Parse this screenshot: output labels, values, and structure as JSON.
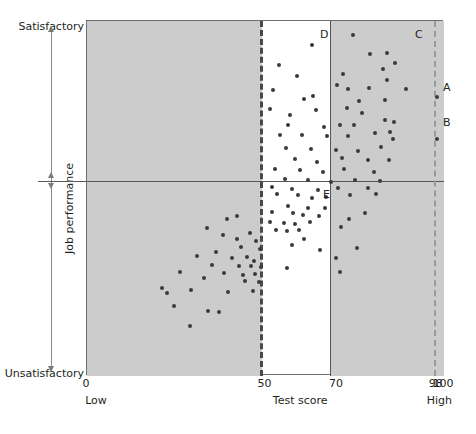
{
  "figure": {
    "y_axis": {
      "top_label": "Satisfactory",
      "bottom_label": "Unsatisfactory",
      "title": "Job performance"
    },
    "x_axis": {
      "title": "Test score",
      "low_label": "Low",
      "high_label": "High",
      "ticks": [
        {
          "value": 0,
          "label": "0"
        },
        {
          "value": 50,
          "label": "50"
        },
        {
          "value": 70,
          "label": "70"
        },
        {
          "value": 98,
          "label": "98"
        },
        {
          "value": 100,
          "label": "100"
        }
      ]
    },
    "quadrant_labels": [
      {
        "id": "D",
        "label": "D",
        "x": 233,
        "y": 8
      },
      {
        "id": "C",
        "label": "C",
        "x": 328,
        "y": 8
      },
      {
        "id": "E",
        "label": "E",
        "x": 236,
        "y": 168
      }
    ],
    "callouts": [
      {
        "id": "A",
        "label": "A",
        "x": 434,
        "y": 82
      },
      {
        "id": "B",
        "label": "B",
        "x": 434,
        "y": 117
      }
    ],
    "reference_lines": [
      {
        "name": "cutoff-50",
        "orientation": "vertical",
        "value": 50,
        "style": "dashed",
        "color": "#4a4a4a"
      },
      {
        "name": "cutoff-70",
        "orientation": "vertical",
        "value": 70,
        "style": "solid",
        "color": "#555555"
      },
      {
        "name": "cutoff-98",
        "orientation": "vertical",
        "value": 98,
        "style": "dashed",
        "color": "#9a9a9a"
      },
      {
        "name": "performance-midline",
        "orientation": "horizontal",
        "value": 50,
        "style": "solid",
        "color": "#555555"
      }
    ],
    "colors": {
      "shaded_region": "#cccccc",
      "plot_background": "#ffffff",
      "point": "#3a3a3a",
      "frame": "#6e6e6e",
      "text": "#231f20"
    },
    "shaded_regions": [
      {
        "name": "below-50",
        "x_from": 0,
        "x_to": 50
      },
      {
        "name": "above-70",
        "x_from": 70,
        "x_to": 100
      }
    ]
  },
  "chart_data": {
    "type": "scatter",
    "title": "",
    "xlabel": "Test score",
    "ylabel": "Job performance",
    "xlim": [
      0,
      100
    ],
    "ylim": [
      0,
      100
    ],
    "grid": false,
    "legend": null,
    "series": [
      {
        "name": "employees",
        "points": [
          [
            63.0,
            93.2
          ],
          [
            53.8,
            87.6
          ],
          [
            74.6,
            96.1
          ],
          [
            79.3,
            90.7
          ],
          [
            84.0,
            91.0
          ],
          [
            86.2,
            88.2
          ],
          [
            58.7,
            84.5
          ],
          [
            71.6,
            85.1
          ],
          [
            82.8,
            86.5
          ],
          [
            83.9,
            83.5
          ],
          [
            52.0,
            80.5
          ],
          [
            63.2,
            79.0
          ],
          [
            69.9,
            82.0
          ],
          [
            73.2,
            80.8
          ],
          [
            79.0,
            81.1
          ],
          [
            89.3,
            80.9
          ],
          [
            60.7,
            78.0
          ],
          [
            76.3,
            77.6
          ],
          [
            83.5,
            77.8
          ],
          [
            98.0,
            78.5
          ],
          [
            51.4,
            75.3
          ],
          [
            57.0,
            73.6
          ],
          [
            64.1,
            74.9
          ],
          [
            72.7,
            75.4
          ],
          [
            77.0,
            74.2
          ],
          [
            83.4,
            72.1
          ],
          [
            56.2,
            70.6
          ],
          [
            66.3,
            70.2
          ],
          [
            70.8,
            70.6
          ],
          [
            74.8,
            70.8
          ],
          [
            86.1,
            71.6
          ],
          [
            54.1,
            68.0
          ],
          [
            60.3,
            67.8
          ],
          [
            67.3,
            67.6
          ],
          [
            73.0,
            67.7
          ],
          [
            80.6,
            68.4
          ],
          [
            84.9,
            68.7
          ],
          [
            85.8,
            66.9
          ],
          [
            98.0,
            66.9
          ],
          [
            55.8,
            64.3
          ],
          [
            62.8,
            64.0
          ],
          [
            69.7,
            63.7
          ],
          [
            75.9,
            63.4
          ],
          [
            82.3,
            64.4
          ],
          [
            58.2,
            61.0
          ],
          [
            64.5,
            60.4
          ],
          [
            71.4,
            61.3
          ],
          [
            78.8,
            60.8
          ],
          [
            84.6,
            60.9
          ],
          [
            52.6,
            58.3
          ],
          [
            59.6,
            58.0
          ],
          [
            66.2,
            57.6
          ],
          [
            72.0,
            58.2
          ],
          [
            80.3,
            57.4
          ],
          [
            55.4,
            55.5
          ],
          [
            61.9,
            55.1
          ],
          [
            68.4,
            54.6
          ],
          [
            75.2,
            55.2
          ],
          [
            82.0,
            54.8
          ],
          [
            51.9,
            53.2
          ],
          [
            57.5,
            52.7
          ],
          [
            64.8,
            52.4
          ],
          [
            70.3,
            53.0
          ],
          [
            78.6,
            52.9
          ],
          [
            53.1,
            51.3
          ],
          [
            59.0,
            50.9
          ],
          [
            66.9,
            50.5
          ],
          [
            73.6,
            51.1
          ],
          [
            80.9,
            51.4
          ],
          [
            63.0,
            50.1
          ],
          [
            56.4,
            47.8
          ],
          [
            62.0,
            47.3
          ],
          [
            66.8,
            47.4
          ],
          [
            51.7,
            46.2
          ],
          [
            57.6,
            45.9
          ],
          [
            60.4,
            45.4
          ],
          [
            64.9,
            45.2
          ],
          [
            42.1,
            45.0
          ],
          [
            39.3,
            44.3
          ],
          [
            51.2,
            43.3
          ],
          [
            55.1,
            43.0
          ],
          [
            58.4,
            42.8
          ],
          [
            62.6,
            43.4
          ],
          [
            53.0,
            41.2
          ],
          [
            56.1,
            40.9
          ],
          [
            59.4,
            41.0
          ],
          [
            77.9,
            46.0
          ],
          [
            73.4,
            44.1
          ],
          [
            71.1,
            42.0
          ],
          [
            60.7,
            38.7
          ],
          [
            57.4,
            37.0
          ],
          [
            65.2,
            35.6
          ],
          [
            75.6,
            36.1
          ],
          [
            69.8,
            33.3
          ],
          [
            55.9,
            30.4
          ],
          [
            71.0,
            29.2
          ],
          [
            33.6,
            41.6
          ],
          [
            38.0,
            39.8
          ],
          [
            45.7,
            40.4
          ],
          [
            41.9,
            38.6
          ],
          [
            47.3,
            38.1
          ],
          [
            43.1,
            36.4
          ],
          [
            48.4,
            35.9
          ],
          [
            36.2,
            34.9
          ],
          [
            30.7,
            33.8
          ],
          [
            40.6,
            33.2
          ],
          [
            44.8,
            33.5
          ],
          [
            46.9,
            32.3
          ],
          [
            35.0,
            31.4
          ],
          [
            42.5,
            31.0
          ],
          [
            45.9,
            30.9
          ],
          [
            48.8,
            30.6
          ],
          [
            26.0,
            29.3
          ],
          [
            38.4,
            29.0
          ],
          [
            43.7,
            28.4
          ],
          [
            47.1,
            28.7
          ],
          [
            32.9,
            27.6
          ],
          [
            44.2,
            26.8
          ],
          [
            48.1,
            26.4
          ],
          [
            21.0,
            24.9
          ],
          [
            22.5,
            23.4
          ],
          [
            29.2,
            24.2
          ],
          [
            39.5,
            23.8
          ],
          [
            46.5,
            24.0
          ],
          [
            24.4,
            19.6
          ],
          [
            33.8,
            18.2
          ],
          [
            37.1,
            18.0
          ],
          [
            28.9,
            14.0
          ]
        ]
      }
    ]
  }
}
